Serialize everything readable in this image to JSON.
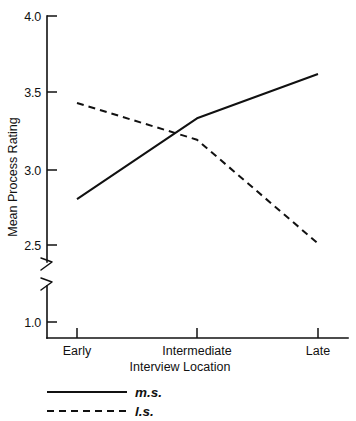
{
  "chart_data": {
    "type": "line",
    "title": "",
    "xlabel": "Interview Location",
    "ylabel": "Mean Process Rating",
    "categories": [
      "Early",
      "Intermediate",
      "Late"
    ],
    "series": [
      {
        "name": "m.s.",
        "style": "solid",
        "values": [
          2.8,
          3.33,
          3.62
        ]
      },
      {
        "name": "l.s.",
        "style": "dashed",
        "values": [
          3.43,
          3.19,
          2.51
        ]
      }
    ],
    "ylim": [
      2.4,
      4.0
    ],
    "y_axis_break": true,
    "y_break_note": "axis break between 2.5 and 1.0",
    "yticks": [
      "4.0",
      "3.5",
      "3.0",
      "2.5",
      "1.0"
    ],
    "ytick_values": [
      4.0,
      3.5,
      3.0,
      2.5,
      1.0
    ],
    "grid": false,
    "legend_position": "below-left",
    "legend": [
      {
        "label": "m.s.",
        "style": "solid"
      },
      {
        "label": "l.s.",
        "style": "dashed"
      }
    ],
    "colors": {
      "line": "#111111",
      "background": "#ffffff"
    }
  },
  "axis": {
    "y_label": "Mean Process Rating",
    "x_label": "Interview Location",
    "y_ticks": [
      {
        "text": "4.0"
      },
      {
        "text": "3.5"
      },
      {
        "text": "3.0"
      },
      {
        "text": "2.5"
      },
      {
        "text": "1.0"
      }
    ],
    "x_ticks": [
      {
        "text": "Early"
      },
      {
        "text": "Intermediate"
      },
      {
        "text": "Late"
      }
    ]
  },
  "legend": {
    "items": [
      {
        "label": "m.s."
      },
      {
        "label": "l.s."
      }
    ]
  }
}
